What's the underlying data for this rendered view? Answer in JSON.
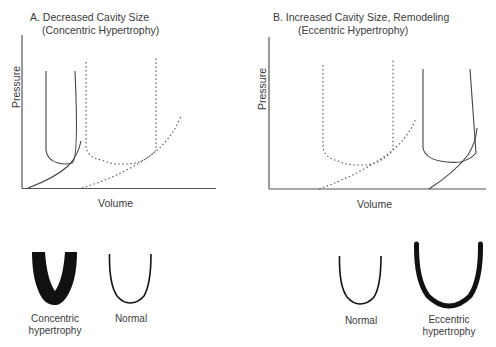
{
  "panels": [
    {
      "id": "A",
      "title_line1": "A. Decreased Cavity Size",
      "title_line2": "(Concentric Hypertrophy)",
      "xlabel": "Volume",
      "ylabel": "Pressure",
      "legend": {
        "solid": "Concentric hypertrophy loop",
        "dotted": "Normal loop"
      }
    },
    {
      "id": "B",
      "title_line1": "B. Increased Cavity Size, Remodeling",
      "title_line2": "(Eccentric Hypertrophy)",
      "xlabel": "Volume",
      "ylabel": "Pressure",
      "legend": {
        "solid": "Eccentric hypertrophy loop",
        "dotted": "Normal loop"
      }
    }
  ],
  "hearts": [
    {
      "label_line1": "Concentric",
      "label_line2": "hypertrophy",
      "style": "thick-filled"
    },
    {
      "label_line1": "Normal",
      "label_line2": "",
      "style": "thin"
    },
    {
      "label_line1": "Normal",
      "label_line2": "",
      "style": "thin"
    },
    {
      "label_line1": "Eccentric",
      "label_line2": "hypertrophy",
      "style": "thick-outline"
    }
  ],
  "colors": {
    "line": "#3a3a3a",
    "fill": "#111111",
    "background": "#ffffff"
  }
}
